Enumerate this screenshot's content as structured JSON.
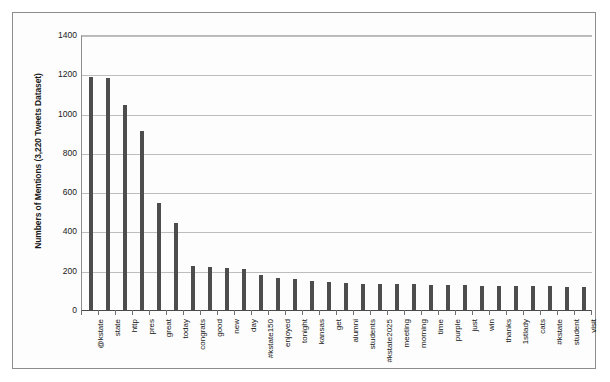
{
  "chart_data": {
    "type": "bar",
    "title": "",
    "xlabel": "",
    "ylabel": "Numbers of Mentions (3,220 Tweets Dataset)",
    "ylim": [
      0,
      1400
    ],
    "ytick_labels": [
      "1400",
      "1200",
      "1000",
      "800",
      "600",
      "400",
      "200",
      "0"
    ],
    "ytick_values": [
      1400,
      1200,
      1000,
      800,
      600,
      400,
      200,
      0
    ],
    "grid": true,
    "legend": "none",
    "bar_color": "#4d4d4d",
    "categories": [
      "@kstate",
      "state",
      "http",
      "pres",
      "great",
      "today",
      "congrats",
      "good",
      "new",
      "day",
      "#kstate150",
      "enjoyed",
      "tonight",
      "kansas",
      "get",
      "alumni",
      "students",
      "#kstate2025",
      "meeting",
      "morning",
      "time",
      "purple",
      "just",
      "win",
      "thanks",
      "1stlady",
      "cats",
      "#kstate",
      "student",
      "visit"
    ],
    "values": [
      1190,
      1185,
      1050,
      915,
      550,
      450,
      230,
      225,
      220,
      215,
      185,
      170,
      165,
      155,
      150,
      145,
      140,
      140,
      135,
      135,
      132,
      130,
      130,
      128,
      128,
      126,
      125,
      125,
      124,
      122
    ]
  }
}
